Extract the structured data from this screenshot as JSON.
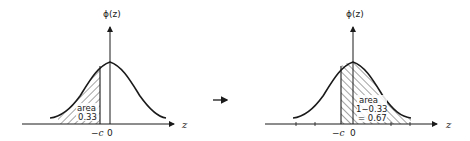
{
  "left_panel": {
    "y_axis_label": "ϕ(z)",
    "x_axis_label": "z",
    "tick_labels": {
      "neg_c": "−c",
      "zero": "0"
    },
    "area_label": "area",
    "area_value": "0.33",
    "shaded_region": "left tail, z < −c",
    "hatch_direction": "forward-slash"
  },
  "transition_arrow": "→",
  "right_panel": {
    "y_axis_label": "ϕ(z)",
    "x_axis_label": "z",
    "tick_labels": {
      "neg_c": "−c",
      "zero": "0"
    },
    "area_label": "area",
    "area_line2": "1−0.33",
    "area_line3": "= 0.67",
    "shaded_region": "z > −c",
    "hatch_direction": "back-slash"
  },
  "colors": {
    "ink": "#1a1a1a",
    "background": "#ffffff"
  }
}
